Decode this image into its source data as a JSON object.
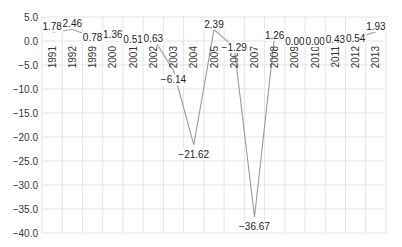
{
  "chart_data": {
    "type": "line",
    "title": "",
    "xlabel": "",
    "ylabel": "",
    "categories": [
      "1991",
      "1992",
      "1999",
      "2000",
      "2001",
      "2002",
      "2003",
      "2004",
      "2005",
      "2006",
      "2007",
      "2008",
      "2009",
      "2010",
      "2011",
      "2012",
      "2013"
    ],
    "series": [
      {
        "name": "value",
        "values": [
          1.78,
          2.46,
          0.78,
          1.36,
          0.51,
          0.63,
          -6.14,
          -21.62,
          2.39,
          -1.29,
          -36.67,
          1.26,
          0.0,
          0.0,
          0.43,
          0.54,
          1.93
        ],
        "labels": [
          "1.78",
          "2.46",
          "0.78",
          "1.36",
          "0.51",
          "0.63",
          "−6.14",
          "−21.62",
          "2.39",
          "−1.29",
          "−36.67",
          "1.26",
          "0.00",
          "0.00",
          "0.43",
          "0.54",
          "1.93"
        ],
        "color": "#9a9a9a"
      }
    ],
    "ylim": [
      -40,
      5
    ],
    "yticks": [
      5,
      0,
      -5,
      -10,
      -15,
      -20,
      -25,
      -30,
      -35,
      -40
    ],
    "ytick_labels": [
      "5.0",
      "0.0",
      "−5.0",
      "−10.0",
      "−15.0",
      "−20.0",
      "−25.0",
      "−30.0",
      "−35.0",
      "−40.0"
    ],
    "grid": true,
    "legend": "none",
    "xtick_rotation": -90,
    "xtick_position": "at y=0, inside plot"
  }
}
